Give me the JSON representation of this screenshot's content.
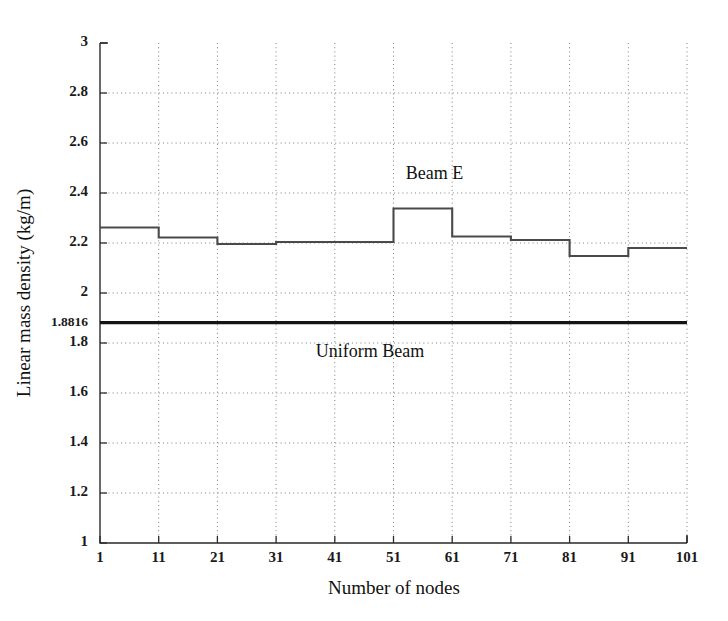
{
  "chart_data": {
    "type": "line",
    "title": "",
    "xlabel": "Number of nodes",
    "ylabel": "Linear mass density (kg/m)",
    "xlim": [
      1,
      101
    ],
    "ylim": [
      1,
      3
    ],
    "grid": true,
    "legend_position": "inline-annotations",
    "x_ticks": [
      1,
      11,
      21,
      31,
      41,
      51,
      61,
      71,
      81,
      91,
      101
    ],
    "x_tick_labels": [
      "1",
      "11",
      "21",
      "31",
      "41",
      "51",
      "61",
      "71",
      "81",
      "91",
      "101"
    ],
    "y_ticks": [
      1,
      1.2,
      1.4,
      1.6,
      1.8,
      1.8816,
      2,
      2.2,
      2.4,
      2.6,
      2.8,
      3
    ],
    "y_tick_labels": [
      "1",
      "1.2",
      "1.4",
      "1.6",
      "1.8",
      "1.8816",
      "2",
      "2.2",
      "2.4",
      "2.6",
      "2.8",
      "3"
    ],
    "series": [
      {
        "name": "Beam E",
        "style": "step-post",
        "color": "#4a4a4a",
        "x": [
          1,
          11,
          21,
          31,
          41,
          51,
          61,
          71,
          81,
          91,
          101
        ],
        "values": [
          2.262,
          2.222,
          2.196,
          2.204,
          2.204,
          2.338,
          2.226,
          2.212,
          2.148,
          2.18,
          2.18
        ],
        "segments": [
          {
            "x_start": 1,
            "x_end": 11,
            "y": 2.262
          },
          {
            "x_start": 11,
            "x_end": 21,
            "y": 2.222
          },
          {
            "x_start": 21,
            "x_end": 31,
            "y": 2.196
          },
          {
            "x_start": 31,
            "x_end": 51,
            "y": 2.204
          },
          {
            "x_start": 51,
            "x_end": 61,
            "y": 2.338
          },
          {
            "x_start": 61,
            "x_end": 71,
            "y": 2.226
          },
          {
            "x_start": 71,
            "x_end": 81,
            "y": 2.212
          },
          {
            "x_start": 81,
            "x_end": 91,
            "y": 2.148
          },
          {
            "x_start": 91,
            "x_end": 101,
            "y": 2.18
          }
        ]
      },
      {
        "name": "Uniform Beam",
        "style": "constant",
        "color": "#141414",
        "x": [
          1,
          101
        ],
        "values": [
          1.8816,
          1.8816
        ]
      }
    ],
    "annotations": [
      {
        "text": "Beam E",
        "x": 58,
        "y": 2.455
      },
      {
        "text": "Uniform Beam",
        "x": 47,
        "y": 1.745
      }
    ]
  },
  "axes": {
    "y_axis_title": "Linear mass density (kg/m)",
    "x_axis_title": "Number of nodes"
  },
  "annotations": {
    "beam_e": "Beam E",
    "uniform_beam": "Uniform Beam"
  },
  "colors": {
    "background": "#ffffff",
    "axis": "#2a2a2a",
    "grid": "#808080",
    "series_beam_e": "#4a4a4a",
    "series_uniform": "#141414"
  }
}
